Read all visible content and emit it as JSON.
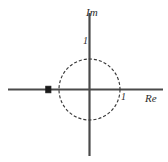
{
  "chart_data": {
    "type": "scatter",
    "title": "",
    "subtitle": "",
    "xlabel": "Re",
    "ylabel": "Im",
    "xlim": [
      -2.7,
      2.6
    ],
    "ylim": [
      -2.2,
      2.7
    ],
    "grid": false,
    "legend": null,
    "annotations": [
      {
        "name": "unit-circle",
        "kind": "circle",
        "center": [
          0,
          0
        ],
        "radius": 1,
        "style": "dashed"
      }
    ],
    "axis_ticks": {
      "x": [
        {
          "value": 1,
          "label": "1"
        }
      ],
      "y": [
        {
          "value": 1,
          "label": "1"
        }
      ]
    },
    "series": [
      {
        "name": "pole",
        "marker": "filled-square",
        "points": [
          {
            "x": -1.35,
            "y": 0
          }
        ]
      }
    ]
  },
  "labels": {
    "imaginary_axis": "Im",
    "real_axis": "Re",
    "tick_real_one": "1",
    "tick_imag_one": "1"
  },
  "colors": {
    "axis": "#4a4a4a",
    "circle": "#3a3a3a",
    "marker": "#1a1a1a",
    "text": "#2b2b2b",
    "background": "#ffffff"
  }
}
